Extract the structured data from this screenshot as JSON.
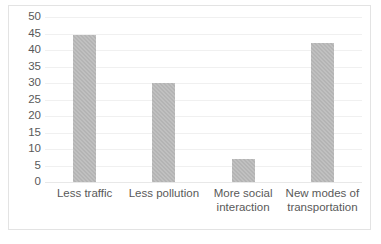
{
  "chart_data": {
    "type": "bar",
    "title": "",
    "subtitle": "",
    "xlabel": "",
    "ylabel": "",
    "categories": [
      "Less traffic",
      "Less pollution",
      "More social interaction",
      "New modes of transportation"
    ],
    "category_lines": [
      [
        "Less traffic",
        ""
      ],
      [
        "Less pollution",
        ""
      ],
      [
        "More social",
        "interaction"
      ],
      [
        "New modes of",
        "transportation"
      ]
    ],
    "values": [
      44.5,
      30,
      7,
      42
    ],
    "ylim": [
      0,
      50
    ],
    "ytick_step": 5,
    "yticks": [
      50,
      45,
      40,
      35,
      30,
      25,
      20,
      15,
      10,
      5,
      0
    ],
    "grid": true,
    "grid_orientation": "horizontal",
    "legend": false,
    "legend_position": "none",
    "series": [
      {
        "name": "",
        "values": [
          44.5,
          30,
          7,
          42
        ],
        "color": "#b4b4b4"
      }
    ],
    "colors": {
      "bar_fill": "#b4b4b4",
      "gridline": "#f0f0f0",
      "axis_line": "#e8e8e8",
      "tick_label": "#595959",
      "plot_background": "#ffffff",
      "chart_border": "#e3e3e3"
    }
  }
}
